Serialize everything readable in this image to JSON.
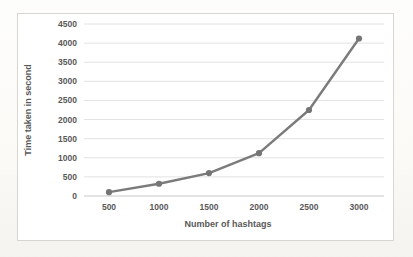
{
  "chart_data": {
    "type": "line",
    "title": "",
    "xlabel": "Number of hashtags",
    "ylabel": "Time taken in second",
    "x": [
      500,
      1000,
      1500,
      2000,
      2500,
      3000
    ],
    "series": [
      {
        "name": "time-taken",
        "values": [
          100,
          320,
          600,
          1120,
          2250,
          4120
        ]
      }
    ],
    "ylim": [
      0,
      4500
    ],
    "ytick_step": 500,
    "yticks": [
      0,
      500,
      1000,
      1500,
      2000,
      2500,
      3000,
      3500,
      4000,
      4500
    ],
    "xticks": [
      "500",
      "1000",
      "1500",
      "2000",
      "2500",
      "3000"
    ],
    "grid": "horizontal",
    "legend_position": "none",
    "marker": "circle"
  },
  "colors": {
    "line": "#7b7b7b",
    "marker": "#757575",
    "gridline": "#e2e2e2",
    "axis_line": "#c9c9c9",
    "text": "#595959",
    "plot_background": "#ffffff",
    "frame_border": "#d9d6d2",
    "page_background": "#fbfaf7"
  }
}
